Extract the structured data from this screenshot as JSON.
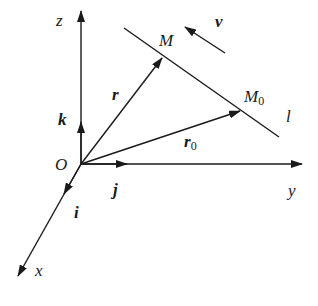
{
  "diagram": {
    "colors": {
      "stroke": "#1a1a1a",
      "background": "#ffffff"
    },
    "axes": {
      "origin_label": "O",
      "x_label": "x",
      "y_label": "y",
      "z_label": "z"
    },
    "unit_vectors": {
      "i": "i",
      "j": "j",
      "k": "k"
    },
    "points": {
      "M": "M",
      "M0_main": "M",
      "M0_sub": "0"
    },
    "vectors": {
      "r": "r",
      "r0_main": "r",
      "r0_sub": "0",
      "v": "v"
    },
    "line_label": "l"
  }
}
